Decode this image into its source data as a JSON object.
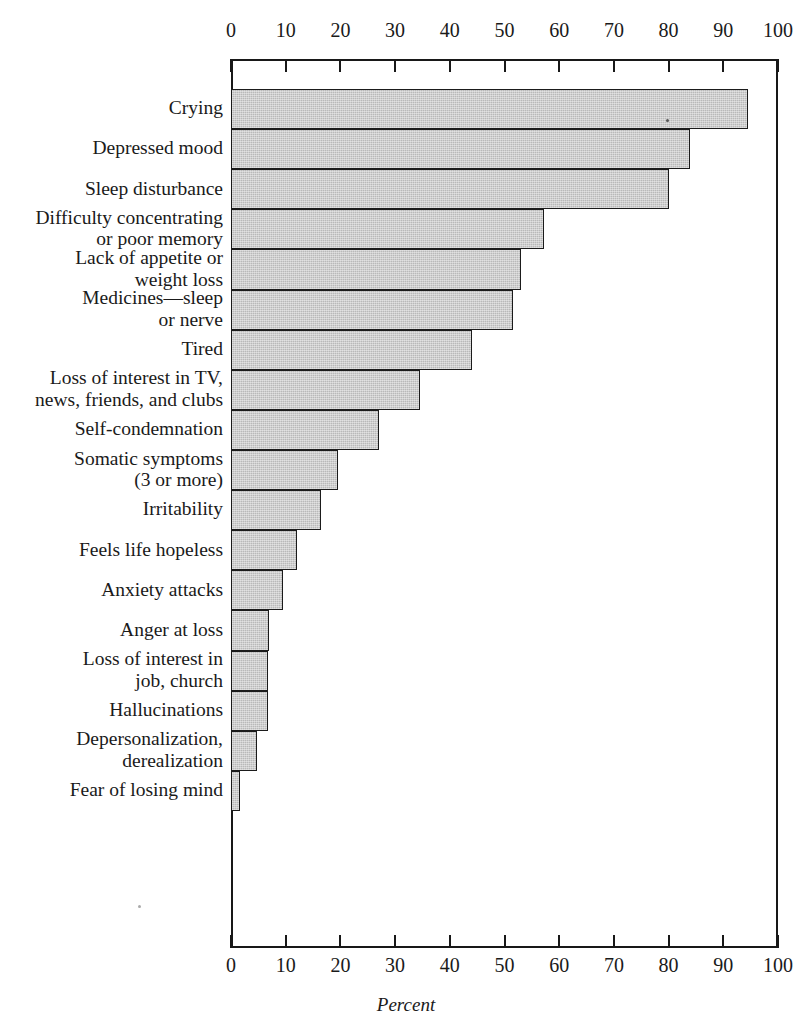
{
  "chart_data": {
    "type": "bar",
    "orientation": "horizontal",
    "title": "",
    "subtitle": "",
    "xlabel": "Percent",
    "ylabel": "",
    "xlim": [
      0,
      100
    ],
    "grid": false,
    "legend": null,
    "axis_ticks_top": [
      "0",
      "10",
      "20",
      "30",
      "40",
      "50",
      "60",
      "70",
      "80",
      "90",
      "100"
    ],
    "axis_ticks_bottom": [
      "0",
      "10",
      "20",
      "30",
      "40",
      "50",
      "60",
      "70",
      "80",
      "90",
      "100"
    ],
    "tick_values": [
      0,
      10,
      20,
      30,
      40,
      50,
      60,
      70,
      80,
      90,
      100
    ],
    "categories": [
      "Crying",
      "Depressed mood",
      "Sleep disturbance",
      "Difficulty concentrating\nor poor memory",
      "Lack of appetite or\nweight loss",
      "Medicines—sleep\nor nerve",
      "Tired",
      "Loss of interest in TV,\nnews, friends, and clubs",
      "Self-condemnation",
      "Somatic symptoms\n(3 or more)",
      "Irritability",
      "Feels life hopeless",
      "Anxiety attacks",
      "Anger at loss",
      "Loss of interest in\njob, church",
      "Hallucinations",
      "Depersonalization,\nderealization",
      "Fear of losing mind"
    ],
    "values": [
      94.5,
      84.0,
      80.0,
      57.2,
      53.0,
      51.6,
      44.0,
      34.5,
      27.0,
      19.5,
      16.5,
      12.0,
      9.5,
      7.0,
      6.8,
      6.8,
      4.8,
      1.7
    ],
    "series": [
      {
        "name": "Percent",
        "values": [
          94.5,
          84.0,
          80.0,
          57.2,
          53.0,
          51.6,
          44.0,
          34.5,
          27.0,
          19.5,
          16.5,
          12.0,
          9.5,
          7.0,
          6.8,
          6.8,
          4.8,
          1.7
        ]
      }
    ],
    "bar_fill_color": "#b9b9b9",
    "bar_edge_color": "#1b1b1b",
    "axis_color": "#181818",
    "background_color": "#ffffff"
  }
}
